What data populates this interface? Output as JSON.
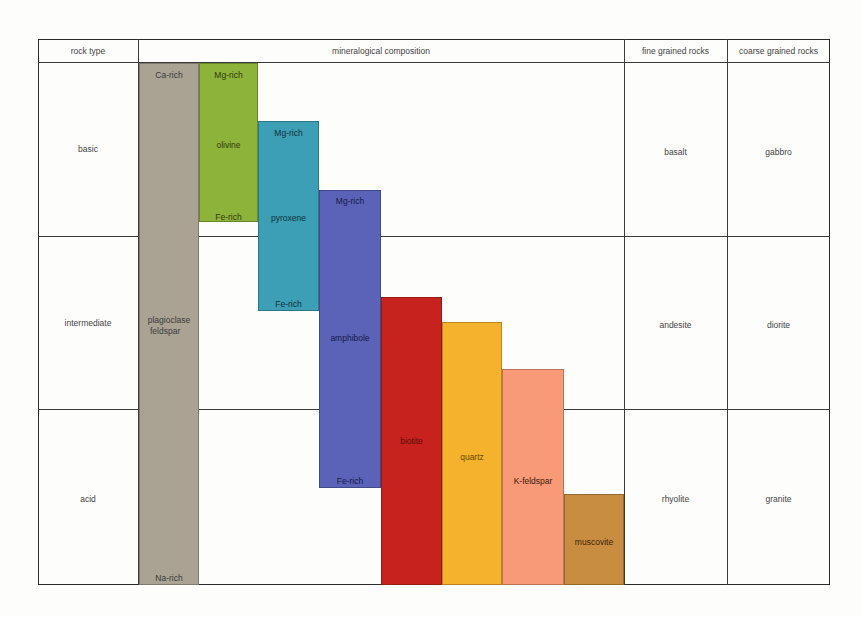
{
  "header": {
    "rock_type": "rock type",
    "mineralogical_composition": "mineralogical composition",
    "fine_grained": "fine grained rocks",
    "coarse_grained": "coarse grained rocks"
  },
  "rows": [
    {
      "rock_type": "basic",
      "fine": "basalt",
      "coarse": "gabbro"
    },
    {
      "rock_type": "intermediate",
      "fine": "andesite",
      "coarse": "diorite"
    },
    {
      "rock_type": "acid",
      "fine": "rhyolite",
      "coarse": "granite"
    }
  ],
  "minerals": {
    "plagioclase": {
      "name_line1": "plagioclase",
      "name_line2": "feldspar",
      "top": "Ca-rich",
      "bottom": "Na-rich",
      "color": "#aaa394"
    },
    "olivine": {
      "name": "olivine",
      "top": "Mg-rich",
      "bottom": "Fe-rich",
      "color": "#8eb33a"
    },
    "pyroxene": {
      "name": "pyroxene",
      "top": "Mg-rich",
      "bottom": "Fe-rich",
      "color": "#3c9fb5"
    },
    "amphibole": {
      "name": "amphibole",
      "top": "Mg-rich",
      "bottom": "Fe-rich",
      "color": "#5a63b7"
    },
    "biotite": {
      "name": "biotite",
      "color": "#c8221e"
    },
    "quartz": {
      "name": "quartz",
      "color": "#f5b22c"
    },
    "kfeldspar": {
      "name": "K-feldspar",
      "color": "#f89a78"
    },
    "muscovite": {
      "name": "muscovite",
      "color": "#c98d42"
    }
  }
}
